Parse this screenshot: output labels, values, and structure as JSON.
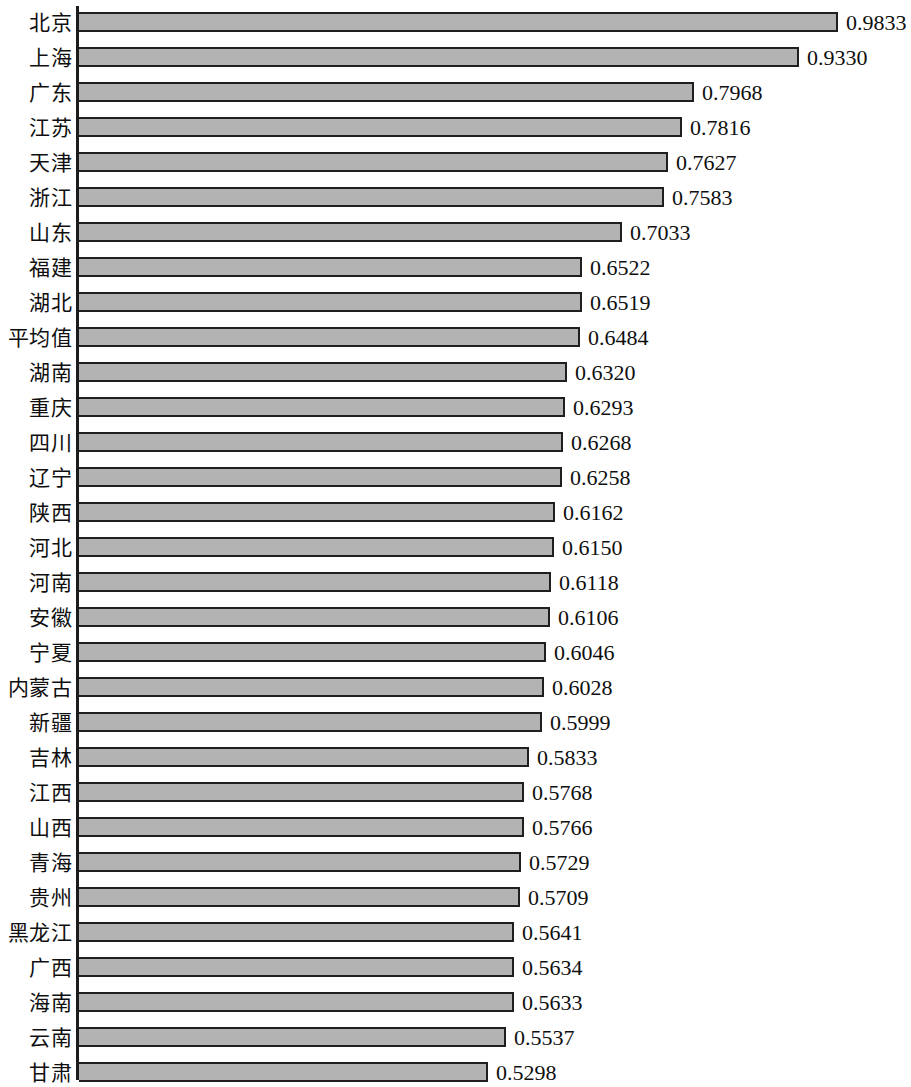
{
  "chart_data": {
    "type": "bar",
    "orientation": "horizontal",
    "title": "",
    "xlabel": "",
    "ylabel": "",
    "xlim": [
      0,
      1.0
    ],
    "grid": false,
    "legend": null,
    "bar_color": "#b3b3b3",
    "bar_border_color": "#1f1f1f",
    "axis_color": "#1c1c1c",
    "value_format": "0.0000",
    "categories": [
      "北京",
      "上海",
      "广东",
      "江苏",
      "天津",
      "浙江",
      "山东",
      "福建",
      "湖北",
      "平均值",
      "湖南",
      "重庆",
      "四川",
      "辽宁",
      "陕西",
      "河北",
      "河南",
      "安徽",
      "宁夏",
      "内蒙古",
      "新疆",
      "吉林",
      "江西",
      "山西",
      "青海",
      "贵州",
      "黑龙江",
      "广西",
      "海南",
      "云南",
      "甘肃"
    ],
    "values": [
      0.9833,
      0.933,
      0.7968,
      0.7816,
      0.7627,
      0.7583,
      0.7033,
      0.6522,
      0.6519,
      0.6484,
      0.632,
      0.6293,
      0.6268,
      0.6258,
      0.6162,
      0.615,
      0.6118,
      0.6106,
      0.6046,
      0.6028,
      0.5999,
      0.5833,
      0.5768,
      0.5766,
      0.5729,
      0.5709,
      0.5641,
      0.5634,
      0.5633,
      0.5537,
      0.5298
    ],
    "value_labels": [
      "0.9833",
      "0.9330",
      "0.7968",
      "0.7816",
      "0.7627",
      "0.7583",
      "0.7033",
      "0.6522",
      "0.6519",
      "0.6484",
      "0.6320",
      "0.6293",
      "0.6268",
      "0.6258",
      "0.6162",
      "0.6150",
      "0.6118",
      "0.6106",
      "0.6046",
      "0.6028",
      "0.5999",
      "0.5833",
      "0.5768",
      "0.5766",
      "0.5729",
      "0.5709",
      "0.5641",
      "0.5634",
      "0.5633",
      "0.5537",
      "0.5298"
    ]
  }
}
